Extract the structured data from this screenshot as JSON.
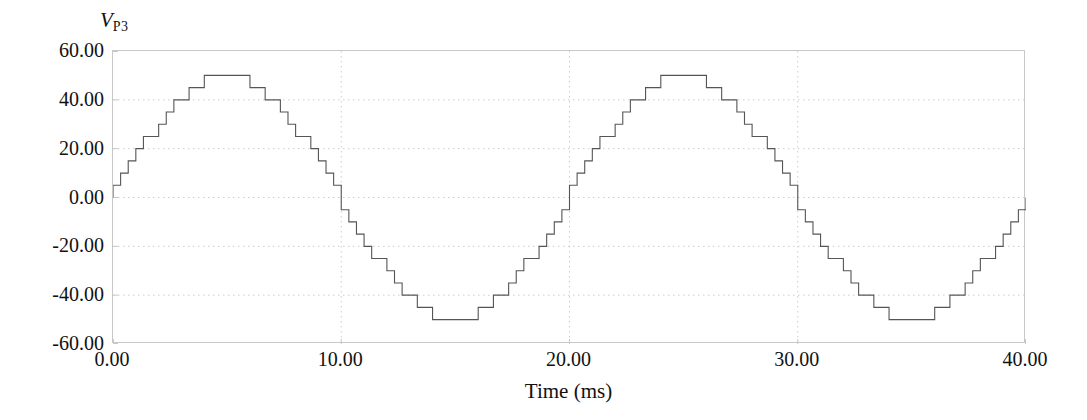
{
  "chart_data": {
    "type": "line",
    "title": "",
    "subtitle": "",
    "ylabel_main": "V",
    "ylabel_sub": "P3",
    "xlabel": "Time (ms)",
    "xlim": [
      0.0,
      40.0
    ],
    "ylim": [
      -60.0,
      60.0
    ],
    "xticks": [
      0.0,
      10.0,
      20.0,
      30.0,
      40.0
    ],
    "xtick_labels": [
      "0.00",
      "10.00",
      "20.00",
      "30.00",
      "40.00"
    ],
    "yticks": [
      60.0,
      40.0,
      20.0,
      0.0,
      -20.0,
      -40.0,
      -60.0
    ],
    "ytick_labels": [
      "60.00",
      "40.00",
      "20.00",
      "0.00",
      "-20.00",
      "-40.00",
      "-60.00"
    ],
    "grid": true,
    "grid_style": "dotted",
    "legend": null,
    "legend_position": "none",
    "series": [
      {
        "name": "V_P3",
        "waveform": "stepped-sine",
        "description": "Quantized (staircase) sine wave output of a multilevel inverter",
        "amplitude": 50.0,
        "offset": 0.0,
        "frequency_hz": 50.0,
        "period_ms": 20.0,
        "periods_shown": 2,
        "steps_per_period": 60,
        "step_duration_ms": 0.3333,
        "color": "#555555",
        "line_width": 1.1,
        "peak_value": 50.0,
        "trough_value": -50.0,
        "start_value": 0.0,
        "end_value": 0.0,
        "zero_crossings_ms": [
          0.0,
          10.0,
          20.0,
          30.0,
          40.0
        ],
        "peak_times_ms": [
          5.0,
          25.0
        ],
        "trough_times_ms": [
          15.0,
          35.0
        ]
      }
    ]
  },
  "colors": {
    "background": "#ffffff",
    "frame": "#c8c8c8",
    "grid": "#cccccc",
    "trace": "#555555",
    "text": "#111111"
  }
}
